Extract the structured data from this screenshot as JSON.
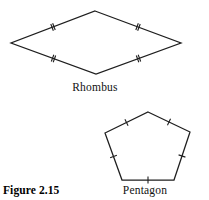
{
  "figure": {
    "caption": "Figure 2.15",
    "background_color": "#ffffff",
    "stroke_color": "#1e1e1e",
    "width": 209,
    "height": 200
  },
  "shapes": [
    {
      "id": "rhombus",
      "label": "Rhombus",
      "sides": 4,
      "tick_count_per_side": 2,
      "tick_meaning": "all-sides-congruent",
      "vertices": [
        {
          "x": 95,
          "y": 11
        },
        {
          "x": 181,
          "y": 43
        },
        {
          "x": 96,
          "y": 74
        },
        {
          "x": 11,
          "y": 43
        }
      ]
    },
    {
      "id": "pentagon",
      "label": "Pentagon",
      "sides": 5,
      "tick_count_per_side": 1,
      "tick_meaning": "all-sides-congruent",
      "vertices": [
        {
          "x": 148,
          "y": 112
        },
        {
          "x": 190,
          "y": 132
        },
        {
          "x": 174,
          "y": 180
        },
        {
          "x": 122,
          "y": 180
        },
        {
          "x": 105,
          "y": 133
        }
      ]
    }
  ]
}
